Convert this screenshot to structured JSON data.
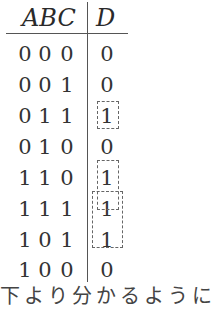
{
  "table": {
    "header": {
      "inputs": "ABC",
      "output": "D"
    },
    "rows": [
      {
        "a": "0",
        "b": "0",
        "c": "0",
        "d": "0"
      },
      {
        "a": "0",
        "b": "0",
        "c": "1",
        "d": "0"
      },
      {
        "a": "0",
        "b": "1",
        "c": "1",
        "d": "1"
      },
      {
        "a": "0",
        "b": "1",
        "c": "0",
        "d": "0"
      },
      {
        "a": "1",
        "b": "1",
        "c": "0",
        "d": "1"
      },
      {
        "a": "1",
        "b": "1",
        "c": "1",
        "d": "1"
      },
      {
        "a": "1",
        "b": "0",
        "c": "1",
        "d": "1"
      },
      {
        "a": "1",
        "b": "0",
        "c": "0",
        "d": "0"
      }
    ],
    "groupings": [
      {
        "rows": [
          2
        ],
        "style": "dashed"
      },
      {
        "rows": [
          4,
          5
        ],
        "style": "dashed"
      },
      {
        "rows": [
          5,
          6
        ],
        "style": "dashed"
      }
    ]
  },
  "footer_text": "下より分かるように"
}
